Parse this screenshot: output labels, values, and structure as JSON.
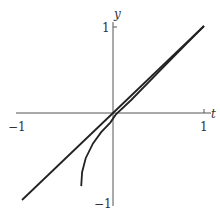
{
  "chart_data": {
    "type": "line",
    "title": "",
    "xlabel": "t",
    "ylabel": "y",
    "xlim": [
      -1,
      1
    ],
    "ylim": [
      -1,
      1
    ],
    "grid": false,
    "legend": null,
    "x_ticks": [
      {
        "value": -1,
        "label": "−1"
      },
      {
        "value": 1,
        "label": "1"
      }
    ],
    "y_ticks": [
      {
        "value": 1,
        "label": "1"
      },
      {
        "value": -1,
        "label": "−1"
      }
    ],
    "series": [
      {
        "name": "line y = t",
        "points": [
          [
            -1,
            -1
          ],
          [
            1,
            1
          ]
        ]
      },
      {
        "name": "curve",
        "points": [
          [
            -0.35,
            -0.84
          ],
          [
            -0.34,
            -0.68
          ],
          [
            -0.3,
            -0.52
          ],
          [
            -0.22,
            -0.35
          ],
          [
            -0.13,
            -0.22
          ],
          [
            -0.03,
            -0.11
          ],
          [
            0.03,
            -0.02
          ],
          [
            0.2,
            0.15
          ],
          [
            0.5,
            0.47
          ],
          [
            0.8,
            0.79
          ],
          [
            1.0,
            1.0
          ]
        ]
      }
    ]
  },
  "labels": {
    "x_axis": "t",
    "y_axis": "y",
    "x_min": "−1",
    "x_max": "1",
    "y_max": "1",
    "y_min": "−1"
  }
}
